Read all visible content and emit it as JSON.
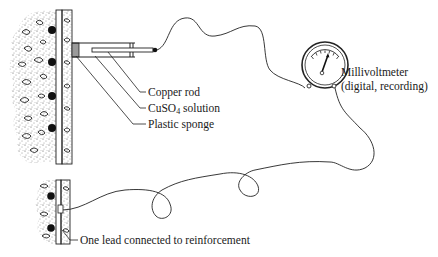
{
  "diagram": {
    "type": "half-cell potential measurement setup",
    "labels": {
      "copper_rod": "Copper rod",
      "cuso4_prefix": "CuSO",
      "cuso4_sub": "4",
      "cuso4_suffix": " solution",
      "plastic_sponge": "Plastic sponge",
      "meter_line1": "Millivoltmeter",
      "meter_line2": "(digital, recording)",
      "lead": "One lead connected to reinforcement"
    },
    "components": [
      "concrete-with-reinforcement",
      "copper-sulfate-electrode",
      "millivoltmeter",
      "lead-wires"
    ],
    "colors": {
      "ink": "#1a1a1a",
      "sponge": "#9a9a9a",
      "background": "#ffffff"
    }
  }
}
